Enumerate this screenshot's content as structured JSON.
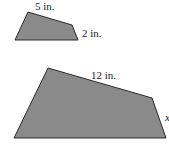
{
  "figure": {
    "fill_color": "#8a8a8a",
    "stroke_color": "#2a2a2a",
    "small_shape": {
      "top_side_label": "5 in.",
      "right_side_label": "2 in."
    },
    "large_shape": {
      "top_side_label": "12 in.",
      "right_side_label": "x"
    }
  }
}
